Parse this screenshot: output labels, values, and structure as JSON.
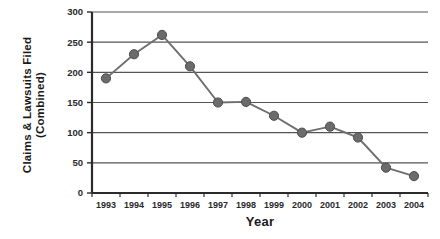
{
  "chart_data": {
    "type": "line",
    "title": "",
    "xlabel": "Year",
    "ylabel": "Claims & Lawsuits Filed (Combined)",
    "ylabel_line1": "Claims & Lawsuits Filed",
    "ylabel_line2": "(Combined)",
    "categories": [
      "1993",
      "1994",
      "1995",
      "1996",
      "1997",
      "1998",
      "1999",
      "2000",
      "2001",
      "2002",
      "2003",
      "2004"
    ],
    "values": [
      190,
      230,
      262,
      210,
      150,
      151,
      128,
      100,
      110,
      92,
      42,
      28
    ],
    "series": [
      {
        "name": "Claims & Lawsuits Filed (Combined)",
        "values": [
          190,
          230,
          262,
          210,
          150,
          151,
          128,
          100,
          110,
          92,
          42,
          28
        ]
      }
    ],
    "ylim": [
      0,
      300
    ],
    "yticks": [
      0,
      50,
      100,
      150,
      200,
      250,
      300
    ],
    "ytick_labels": [
      "0",
      "50",
      "100",
      "150",
      "200",
      "250",
      "300"
    ],
    "grid": "horizontal",
    "legend": "none",
    "marker": "circle",
    "colors": {
      "line": "#6e6e6e",
      "marker": "#6b6b6b",
      "marker_edge": "#4d4d4d",
      "axis": "#2b2b2b",
      "gridline": "#555555",
      "text": "#1a1a1a",
      "background": "#ffffff"
    }
  }
}
